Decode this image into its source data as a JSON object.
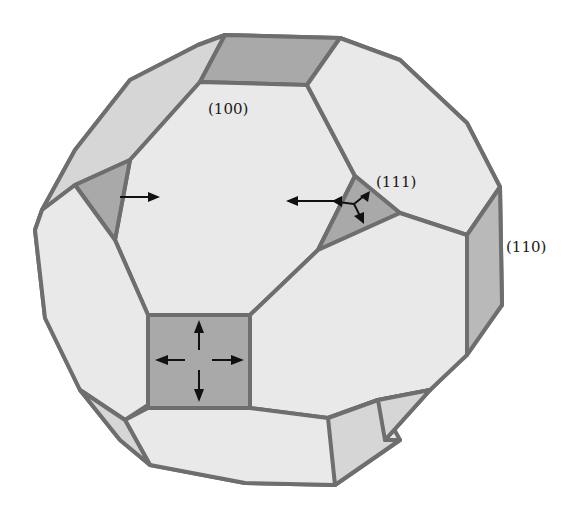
{
  "figure": {
    "labels": {
      "face_100": "(100)",
      "face_111": "(111)",
      "face_110": "(110)"
    },
    "face_families": [
      {
        "id": "100",
        "label": "(100)",
        "shade": "#e9e9e9",
        "arrow_count_on_square": 4
      },
      {
        "id": "111",
        "label": "(111)",
        "shade": "#a9a9a9",
        "arrow_count": 3
      },
      {
        "id": "110",
        "label": "(110)",
        "shade": "#c4c4c4"
      }
    ],
    "colors": {
      "edge": "#6e6e6e",
      "light_face": "#e9e9e9",
      "dark_face": "#a9a9a9",
      "arrow": "#111111",
      "background": "#ffffff"
    }
  }
}
